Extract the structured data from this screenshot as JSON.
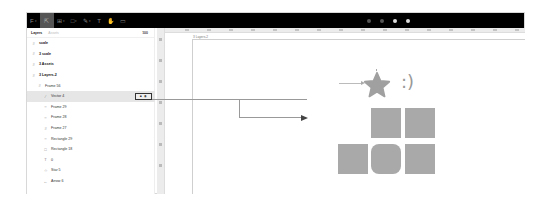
{
  "toolbar": {
    "tools": [
      {
        "name": "menu",
        "glyph": "F",
        "active": false
      },
      {
        "name": "move",
        "glyph": "⇱",
        "active": true
      },
      {
        "name": "frame",
        "glyph": "⊞",
        "active": false
      },
      {
        "name": "shape",
        "glyph": "□",
        "active": false
      },
      {
        "name": "pen",
        "glyph": "✎",
        "active": false
      },
      {
        "name": "text",
        "glyph": "T",
        "active": false
      },
      {
        "name": "hand",
        "glyph": "✋",
        "active": false
      },
      {
        "name": "comment",
        "glyph": "▭",
        "active": false
      }
    ]
  },
  "sidebar": {
    "tabs": [
      {
        "label": "Layers",
        "active": true
      },
      {
        "label": "Assets",
        "active": false
      }
    ],
    "zoom": "100",
    "layers": [
      {
        "label": "scale",
        "icon": "#",
        "indent": 0,
        "bold": true
      },
      {
        "label": "3 scale",
        "icon": "#",
        "indent": 0,
        "bold": true
      },
      {
        "label": "3 Assets",
        "icon": "#",
        "indent": 0,
        "bold": true
      },
      {
        "label": "3 Layers-2",
        "icon": "#",
        "indent": 0,
        "bold": true
      },
      {
        "label": "Frame 56",
        "icon": "#",
        "indent": 1,
        "bold": false
      },
      {
        "label": "Vector 4",
        "icon": "⁄",
        "indent": 2,
        "bold": false,
        "selected": true
      },
      {
        "label": "Frame 29",
        "icon": "○",
        "indent": 2,
        "bold": false
      },
      {
        "label": "Frame 28",
        "icon": "○",
        "indent": 2,
        "bold": false
      },
      {
        "label": "Frame 27",
        "icon": "#",
        "indent": 2,
        "bold": false
      },
      {
        "label": "Rectangle 29",
        "icon": "○",
        "indent": 2,
        "bold": false
      },
      {
        "label": "Rectangle 18",
        "icon": "□",
        "indent": 2,
        "bold": false
      },
      {
        "label": "0",
        "icon": "T",
        "indent": 2,
        "bold": false
      },
      {
        "label": "Star 5",
        "icon": "☆",
        "indent": 2,
        "bold": false
      },
      {
        "label": "Arrow 6",
        "icon": "←",
        "indent": 2,
        "bold": false
      }
    ],
    "selected_actions": [
      "lock-icon",
      "eye-icon"
    ]
  },
  "canvas": {
    "frame_label": "3 Layers-2",
    "smiley": ":)",
    "shape_color": "#a9a9a9"
  }
}
